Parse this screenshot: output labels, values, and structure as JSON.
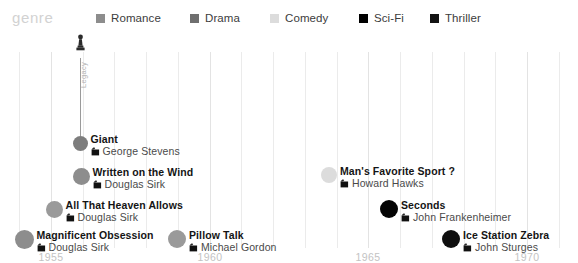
{
  "legend": {
    "title": "genre",
    "items": [
      {
        "label": "Romance",
        "color": "#8d8d8d",
        "x": 96
      },
      {
        "label": "Drama",
        "color": "#6f6f6f",
        "x": 190
      },
      {
        "label": "Comedy",
        "color": "#dcdcdc",
        "x": 270
      },
      {
        "label": "Sci-Fi",
        "color": "#000000",
        "x": 359
      },
      {
        "label": "Thriller",
        "color": "#131313",
        "x": 430
      }
    ]
  },
  "annotation": {
    "icon_name": "oscar-statuette-icon",
    "vertical_label": "Legacy"
  },
  "chart_data": {
    "type": "scatter",
    "title": "",
    "xlabel": "",
    "ylabel": "",
    "legend_position": "top",
    "grid": true,
    "xlim": [
      1953.4,
      1971.6
    ],
    "tick_labels": [
      "1955",
      "1960",
      "1965",
      "1970"
    ],
    "tick_values": [
      1955,
      1960,
      1965,
      1970
    ],
    "gridline_years": [
      1954,
      1955,
      1956,
      1957,
      1958,
      1959,
      1960,
      1961,
      1962,
      1963,
      1964,
      1965,
      1966,
      1967,
      1968,
      1969,
      1970,
      1971
    ],
    "series": [
      {
        "name": "Giant",
        "director": "George Stevens",
        "genre": "Drama",
        "color": "#7d7d7d",
        "year": 1956,
        "x": 80,
        "y": 113,
        "r": 7.5,
        "has_oscar": true
      },
      {
        "name": "Written on the Wind",
        "director": "Douglas Sirk",
        "genre": "Romance",
        "color": "#8d8d8d",
        "year": 1956,
        "x": 81,
        "y": 146,
        "r": 8.5
      },
      {
        "name": "All That Heaven Allows",
        "director": "Douglas Sirk",
        "genre": "Romance",
        "color": "#9a9a9a",
        "year": 1955,
        "x": 54,
        "y": 179,
        "r": 8.5
      },
      {
        "name": "Magnificent Obsession",
        "director": "Douglas Sirk",
        "genre": "Romance",
        "color": "#8d8d8d",
        "year": 1954,
        "x": 24,
        "y": 209,
        "r": 9.5
      },
      {
        "name": "Pillow Talk",
        "director": "Michael Gordon",
        "genre": "Romance",
        "color": "#9a9a9a",
        "year": 1959,
        "x": 177,
        "y": 209,
        "r": 9
      },
      {
        "name": "Man's Favorite Sport ?",
        "director": "Howard Hawks",
        "genre": "Comedy",
        "color": "#dcdcdc",
        "year": 1964,
        "x": 329,
        "y": 145,
        "r": 8
      },
      {
        "name": "Seconds",
        "director": "John Frankenheimer",
        "genre": "Sci-Fi",
        "color": "#050505",
        "year": 1966,
        "x": 389,
        "y": 179,
        "r": 9
      },
      {
        "name": "Ice Station Zebra",
        "director": "John Sturges",
        "genre": "Thriller",
        "color": "#0f0f0f",
        "year": 1968,
        "x": 451,
        "y": 209,
        "r": 9
      }
    ]
  }
}
